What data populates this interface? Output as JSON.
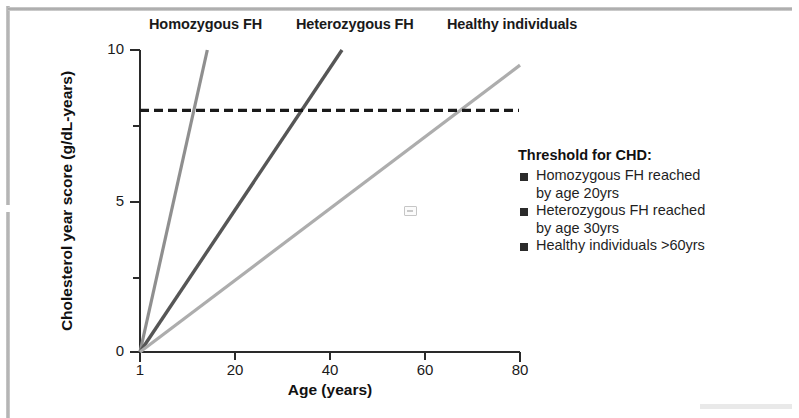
{
  "chart_data": {
    "type": "line",
    "title": "",
    "xlabel": "Age (years)",
    "ylabel": "Cholesterol year score (g/dL-years)",
    "xlim": [
      1,
      80
    ],
    "ylim": [
      0,
      10
    ],
    "xticks": [
      1,
      20,
      40,
      60,
      80
    ],
    "xtick_labels": [
      "1",
      "20",
      "40",
      "60",
      "80"
    ],
    "yticks": [
      0,
      2.5,
      5,
      7.5,
      10
    ],
    "ytick_labels": [
      "0",
      "",
      "5",
      "",
      "10"
    ],
    "grid": false,
    "legend_position": "right",
    "series": [
      {
        "name": "Homozygous FH",
        "color": "#8f8f8f",
        "x": [
          1,
          15
        ],
        "y": [
          0,
          10
        ],
        "slope_per_year": 0.714,
        "threshold_crossing_age": 12,
        "caption": "Homozygous FH"
      },
      {
        "name": "Heterozygous FH",
        "color": "#565656",
        "x": [
          1,
          43
        ],
        "y": [
          0,
          10
        ],
        "slope_per_year": 0.238,
        "threshold_crossing_age": 35,
        "caption": "Heterozygous FH"
      },
      {
        "name": "Healthy individuals",
        "color": "#adadad",
        "x": [
          1,
          80
        ],
        "y": [
          0,
          9.5
        ],
        "slope_per_year": 0.12,
        "threshold_crossing_age": 67,
        "caption": "Healthy individuals"
      }
    ],
    "annotations": [
      {
        "type": "hline",
        "name": "threshold-for-chd",
        "value": 8,
        "style": "dashed",
        "color": "#1a1a1a",
        "label": "Threshold for CHD"
      }
    ]
  },
  "captions": {
    "homozygous": "Homozygous FH",
    "heterozygous": "Heterozygous FH",
    "healthy": "Healthy individuals"
  },
  "axes": {
    "y_title": "Cholesterol year score (g/dL-years)",
    "x_title": "Age (years)",
    "y_labels": {
      "top": "10",
      "mid": "5",
      "bottom": "0"
    },
    "x_labels": {
      "t1": "1",
      "t20": "20",
      "t40": "40",
      "t60": "60",
      "t80": "80"
    }
  },
  "legend": {
    "title": "Threshold for CHD:",
    "items": [
      {
        "icon": "square-bullet",
        "text": "Homozygous FH reached\nby age 20yrs"
      },
      {
        "icon": "square-bullet",
        "text": "Heterozygous FH reached\nby age 30yrs"
      },
      {
        "icon": "square-bullet",
        "text": "Healthy individuals >60yrs"
      }
    ]
  },
  "colors": {
    "homozygous": "#8f8f8f",
    "heterozygous": "#565656",
    "healthy": "#adadad",
    "threshold": "#1a1a1a",
    "text": "#1a1a1a"
  }
}
